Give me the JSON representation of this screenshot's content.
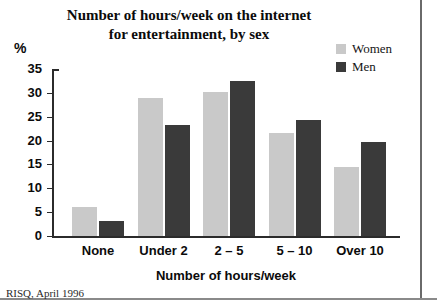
{
  "chart_data": {
    "type": "bar",
    "title": "Number of hours/week on the internet for entertainment, by sex",
    "title_line1": "Number of hours/week on the internet",
    "title_line2": "for entertainment, by sex",
    "xlabel": "Number of hours/week",
    "ylabel": "%",
    "ylim": [
      0,
      35
    ],
    "yticks": [
      0,
      5,
      10,
      15,
      20,
      25,
      30,
      35
    ],
    "ytick_labels": [
      "0",
      "5",
      "10",
      "15",
      "20",
      "25",
      "30",
      "35"
    ],
    "grid": false,
    "legend_position": "top-right",
    "categories": [
      "None",
      "Under 2",
      "2 – 5",
      "5 – 10",
      "Over 10"
    ],
    "series": [
      {
        "name": "Women",
        "color": "#c9c9c9",
        "values": [
          6.0,
          29.0,
          30.2,
          21.5,
          14.5
        ]
      },
      {
        "name": "Men",
        "color": "#3a3a3a",
        "values": [
          3.2,
          23.2,
          32.4,
          24.4,
          19.6
        ]
      }
    ],
    "source_note": "RISQ, April 1996"
  },
  "legend": {
    "items": [
      {
        "label": "Women",
        "color": "#c9c9c9"
      },
      {
        "label": "Men",
        "color": "#3a3a3a"
      }
    ]
  }
}
